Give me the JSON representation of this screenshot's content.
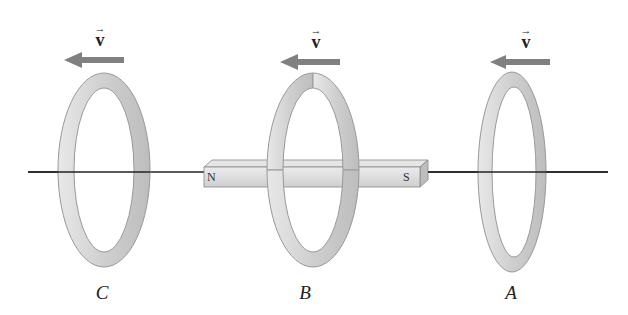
{
  "figure": {
    "velocity_symbol": "v",
    "velocity_arrow": "→",
    "rings": [
      {
        "label": "C",
        "cx": 104
      },
      {
        "label": "B",
        "cx": 313
      },
      {
        "label": "A",
        "cx": 512
      }
    ],
    "magnet": {
      "north_label": "N",
      "south_label": "S"
    },
    "colors": {
      "ring": "#d0d0d0",
      "ring_edge": "#9a9a9a",
      "arrow": "#808080",
      "magnet": "#d8d8d8",
      "axis": "#222222"
    }
  }
}
